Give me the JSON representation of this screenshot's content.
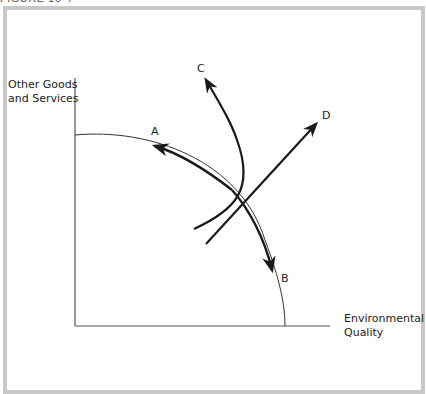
{
  "caption": "FIGURE 16-4",
  "diagram": {
    "y_axis_label_line1": "Other Goods",
    "y_axis_label_line2": "and Services",
    "x_axis_label_line1": "Environmental",
    "x_axis_label_line2": "Quality",
    "points": {
      "A": "A",
      "B": "B",
      "C": "C",
      "D": "D"
    },
    "colors": {
      "line": "#1a1a1a",
      "frame": "#c8c8c8",
      "axis": "#555555"
    }
  }
}
